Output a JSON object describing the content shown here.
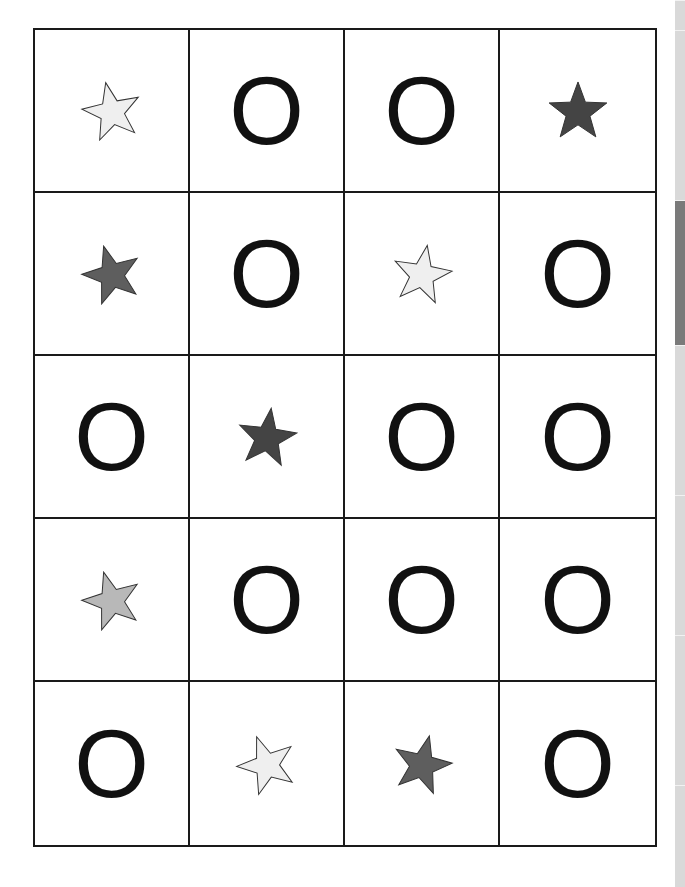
{
  "worksheet": {
    "rows": 5,
    "columns": 4,
    "cells": [
      {
        "type": "star",
        "fill": "#efefef",
        "rotate": -12
      },
      {
        "type": "letter",
        "text": "O"
      },
      {
        "type": "letter",
        "text": "O"
      },
      {
        "type": "star",
        "fill": "#444444",
        "rotate": 0
      },
      {
        "type": "star",
        "fill": "#5e5e5e",
        "rotate": -16
      },
      {
        "type": "letter",
        "text": "O"
      },
      {
        "type": "star",
        "fill": "#efefef",
        "rotate": 10
      },
      {
        "type": "letter",
        "text": "O"
      },
      {
        "type": "letter",
        "text": "O"
      },
      {
        "type": "star",
        "fill": "#444444",
        "rotate": 8
      },
      {
        "type": "letter",
        "text": "O"
      },
      {
        "type": "letter",
        "text": "O"
      },
      {
        "type": "star",
        "fill": "#b8b8b8",
        "rotate": -16
      },
      {
        "type": "letter",
        "text": "O"
      },
      {
        "type": "letter",
        "text": "O"
      },
      {
        "type": "letter",
        "text": "O"
      },
      {
        "type": "letter",
        "text": "O"
      },
      {
        "type": "star",
        "fill": "#efefef",
        "rotate": -20
      },
      {
        "type": "star",
        "fill": "#5e5e5e",
        "rotate": 14
      },
      {
        "type": "letter",
        "text": "O"
      }
    ]
  },
  "side_strip": {
    "color": "#d9d9d9",
    "active_color": "#7a7a7a",
    "segments": [
      {
        "top": 0,
        "height": 30,
        "active": false
      },
      {
        "top": 30,
        "height": 170,
        "active": false
      },
      {
        "top": 200,
        "height": 145,
        "active": true
      },
      {
        "top": 345,
        "height": 150,
        "active": false
      },
      {
        "top": 495,
        "height": 140,
        "active": false
      },
      {
        "top": 635,
        "height": 150,
        "active": false
      },
      {
        "top": 785,
        "height": 101,
        "active": false
      }
    ]
  }
}
